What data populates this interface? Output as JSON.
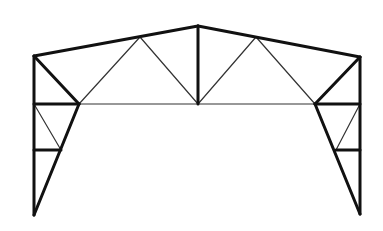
{
  "diagram": {
    "type": "portal-frame-truss",
    "background": "#ffffff",
    "stroke_color": "#111111",
    "nodes": {
      "left_base": [
        34,
        215
      ],
      "left_mid_low": [
        34,
        150
      ],
      "left_eave_chord": [
        34,
        104
      ],
      "left_eave_top": [
        34,
        56
      ],
      "left_knee": [
        79,
        104
      ],
      "left_strut": [
        61,
        150
      ],
      "left_top_node": [
        140,
        37
      ],
      "apex": [
        198,
        26
      ],
      "center_bottom": [
        198,
        104
      ],
      "right_top_node": [
        256,
        37
      ],
      "right_eave_top": [
        360,
        57
      ],
      "right_eave_chord": [
        360,
        104
      ],
      "right_knee": [
        315,
        104
      ],
      "right_strut": [
        336,
        150
      ],
      "right_mid_low": [
        360,
        150
      ],
      "right_base": [
        360,
        214
      ]
    },
    "thick_members": [
      [
        "left_base",
        "left_eave_top"
      ],
      [
        "left_eave_top",
        "apex"
      ],
      [
        "apex",
        "right_eave_top"
      ],
      [
        "right_eave_top",
        "right_base"
      ],
      [
        "left_eave_top",
        "left_knee"
      ],
      [
        "right_eave_top",
        "right_knee"
      ],
      [
        "left_eave_chord",
        "left_knee"
      ],
      [
        "right_knee",
        "right_eave_chord"
      ],
      [
        "left_knee",
        "left_base"
      ],
      [
        "right_knee",
        "right_base"
      ],
      [
        "apex",
        "center_bottom"
      ],
      [
        "left_mid_low",
        "left_strut"
      ],
      [
        "right_strut",
        "right_mid_low"
      ]
    ],
    "thin_members": [
      [
        "left_knee",
        "right_knee"
      ],
      [
        "left_knee",
        "left_top_node"
      ],
      [
        "left_top_node",
        "center_bottom"
      ],
      [
        "center_bottom",
        "right_top_node"
      ],
      [
        "right_top_node",
        "right_knee"
      ],
      [
        "left_eave_chord",
        "left_strut"
      ],
      [
        "right_eave_chord",
        "right_strut"
      ]
    ]
  }
}
